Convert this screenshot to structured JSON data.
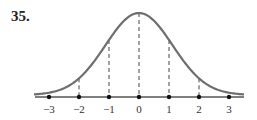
{
  "problem": {
    "number": "35."
  },
  "colors": {
    "curve": "#6e6e6e",
    "axis": "#555555",
    "dash": "#444444",
    "dot": "#111111",
    "text": "#333333"
  },
  "chart_data": {
    "type": "line",
    "title": "",
    "xlabel": "",
    "ylabel": "",
    "x_ticks": [
      -3,
      -2,
      -1,
      0,
      1,
      2,
      3
    ],
    "tick_labels": [
      "−3",
      "−2",
      "−1",
      "0",
      "1",
      "2",
      "3"
    ],
    "dashed_verticals_at": [
      -2,
      -1,
      0,
      1,
      2
    ],
    "series": [
      {
        "name": "normal density",
        "x": [
          -3,
          -2,
          -1,
          0,
          1,
          2,
          3
        ],
        "y": [
          0.004,
          0.054,
          0.242,
          0.399,
          0.242,
          0.054,
          0.004
        ]
      }
    ],
    "xlim": [
      -3.5,
      3.5
    ],
    "grid": false,
    "legend": false
  }
}
